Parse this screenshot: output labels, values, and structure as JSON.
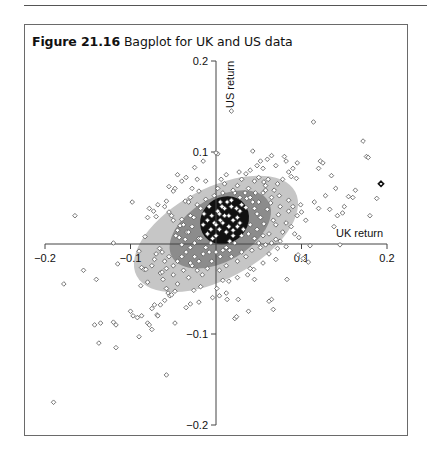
{
  "figure": {
    "label": "Figure 21.16",
    "title": "Bagplot for UK and US data"
  },
  "chart_data": {
    "type": "scatter",
    "subtype": "bagplot",
    "title": "Bagplot for UK and US data",
    "xlabel": "UK return",
    "ylabel": "US return",
    "xlim": [
      -0.2,
      0.2
    ],
    "ylim": [
      -0.2,
      0.2
    ],
    "xticks": [
      -0.2,
      -0.1,
      0.1,
      0.2
    ],
    "yticks": [
      0.2,
      0.1,
      -0.1,
      -0.2
    ],
    "xtick_labels": [
      "-0.2",
      "-0.1",
      "0.1",
      "0.2"
    ],
    "ytick_labels": [
      "0.2",
      "0.1",
      "-0.1",
      "-0.2"
    ],
    "grid": false,
    "legend": null,
    "axes_through_origin": true,
    "colors": {
      "fence": "#c6c6c6",
      "bag": "#8c8c8c",
      "center": "#111111",
      "points": "#555555"
    },
    "regions": {
      "fence_ellipse": {
        "cx": 0.0,
        "cy": 0.01,
        "rx": 0.105,
        "ry": 0.05,
        "angle_deg": -28
      },
      "bag_ellipse": {
        "cx": 0.005,
        "cy": 0.015,
        "rx": 0.065,
        "ry": 0.035,
        "angle_deg": -30
      },
      "center_blob": {
        "cx": 0.01,
        "cy": 0.025,
        "rx": 0.03,
        "ry": 0.025,
        "angle_deg": -40
      }
    },
    "outlier_marked": {
      "x": 0.193,
      "y": 0.065
    },
    "points": [
      [
        -0.19,
        -0.175
      ],
      [
        -0.178,
        -0.045
      ],
      [
        -0.165,
        0.03
      ],
      [
        -0.155,
        -0.03
      ],
      [
        -0.14,
        -0.04
      ],
      [
        -0.142,
        -0.09
      ],
      [
        -0.135,
        -0.088
      ],
      [
        -0.137,
        -0.11
      ],
      [
        -0.12,
        -0.087
      ],
      [
        -0.117,
        -0.09
      ],
      [
        -0.115,
        -0.023
      ],
      [
        -0.12,
        0.0
      ],
      [
        -0.117,
        -0.115
      ],
      [
        -0.098,
        0.045
      ],
      [
        -0.09,
        -0.009
      ],
      [
        -0.087,
        -0.027
      ],
      [
        -0.088,
        -0.047
      ],
      [
        -0.09,
        -0.103
      ],
      [
        -0.084,
        -0.029
      ],
      [
        -0.082,
        -0.029
      ],
      [
        -0.08,
        -0.043
      ],
      [
        -0.08,
        -0.088
      ],
      [
        -0.083,
        0.007
      ],
      [
        -0.075,
        -0.095
      ],
      [
        -0.069,
        -0.079
      ],
      [
        -0.068,
        -0.08
      ],
      [
        -0.065,
        -0.068
      ],
      [
        -0.065,
        -0.033
      ],
      [
        -0.063,
        -0.032
      ],
      [
        -0.058,
        -0.05
      ],
      [
        -0.056,
        -0.055
      ],
      [
        -0.054,
        -0.058
      ],
      [
        -0.052,
        -0.057
      ],
      [
        -0.048,
        -0.088
      ],
      [
        -0.048,
        -0.053
      ],
      [
        -0.058,
        -0.145
      ],
      [
        -0.1,
        -0.075
      ],
      [
        -0.097,
        -0.08
      ],
      [
        -0.092,
        -0.082
      ],
      [
        -0.087,
        -0.08
      ],
      [
        -0.08,
        0.028
      ],
      [
        -0.078,
        0.038
      ],
      [
        -0.073,
        0.035
      ],
      [
        -0.07,
        0.029
      ],
      [
        -0.068,
        0.042
      ],
      [
        -0.06,
        0.04
      ],
      [
        -0.058,
        0.046
      ],
      [
        -0.055,
        0.034
      ],
      [
        -0.052,
        0.03
      ],
      [
        -0.05,
        0.025
      ],
      [
        -0.078,
        -0.09
      ],
      [
        -0.075,
        -0.072
      ],
      [
        -0.072,
        -0.068
      ],
      [
        -0.06,
        -0.063
      ],
      [
        -0.047,
        0.008
      ],
      [
        -0.045,
        0.014
      ],
      [
        -0.043,
        0.006
      ],
      [
        -0.042,
        0.019
      ],
      [
        -0.04,
        0.026
      ],
      [
        -0.038,
        0.02
      ],
      [
        -0.036,
        0.046
      ],
      [
        -0.034,
        0.012
      ],
      [
        -0.032,
        0.045
      ],
      [
        -0.03,
        0.05
      ],
      [
        -0.03,
        0.03
      ],
      [
        -0.028,
        0.06
      ],
      [
        -0.025,
        0.083
      ],
      [
        -0.022,
        0.07
      ],
      [
        -0.015,
        0.09
      ],
      [
        -0.012,
        0.068
      ],
      [
        -0.02,
        0.057
      ],
      [
        -0.035,
        0.072
      ],
      [
        -0.04,
        0.068
      ],
      [
        -0.045,
        0.075
      ],
      [
        -0.048,
        0.06
      ],
      [
        -0.05,
        0.057
      ],
      [
        -0.055,
        0.062
      ],
      [
        0.018,
        0.145
      ],
      [
        0.002,
        0.098
      ],
      [
        0.0,
        0.099
      ],
      [
        0.027,
        0.078
      ],
      [
        0.043,
        0.101
      ],
      [
        0.056,
        0.067
      ],
      [
        0.061,
        0.07
      ],
      [
        0.058,
        0.063
      ],
      [
        0.046,
        0.055
      ],
      [
        0.036,
        0.049
      ],
      [
        0.058,
        0.058
      ],
      [
        0.074,
        0.052
      ],
      [
        0.085,
        0.047
      ],
      [
        0.094,
        0.071
      ],
      [
        0.1,
        0.034
      ],
      [
        0.114,
        0.133
      ],
      [
        0.12,
        0.082
      ],
      [
        0.122,
        0.09
      ],
      [
        0.125,
        0.088
      ],
      [
        0.135,
        0.074
      ],
      [
        0.14,
        0.06
      ],
      [
        0.142,
        0.03
      ],
      [
        0.148,
        0.033
      ],
      [
        0.15,
        0.04
      ],
      [
        0.155,
        0.051
      ],
      [
        0.16,
        0.05
      ],
      [
        0.163,
        0.058
      ],
      [
        0.172,
        0.112
      ],
      [
        0.176,
        0.095
      ],
      [
        0.178,
        0.094
      ],
      [
        0.18,
        0.03
      ],
      [
        0.188,
        0.049
      ],
      [
        0.145,
        -0.002
      ],
      [
        0.11,
        -0.003
      ],
      [
        0.082,
        -0.004
      ],
      [
        0.052,
        -0.005
      ],
      [
        0.096,
        -0.013
      ],
      [
        0.108,
        -0.021
      ],
      [
        0.102,
        -0.017
      ],
      [
        0.062,
        -0.012
      ],
      [
        0.07,
        -0.018
      ],
      [
        0.055,
        -0.022
      ],
      [
        0.044,
        -0.029
      ],
      [
        0.04,
        -0.028
      ],
      [
        0.037,
        -0.035
      ],
      [
        0.025,
        -0.038
      ],
      [
        0.015,
        -0.042
      ],
      [
        0.008,
        -0.041
      ],
      [
        0.012,
        -0.055
      ],
      [
        0.004,
        -0.058
      ],
      [
        0.013,
        -0.062
      ],
      [
        0.026,
        -0.062
      ],
      [
        0.038,
        -0.075
      ],
      [
        0.065,
        -0.062
      ],
      [
        0.067,
        -0.073
      ],
      [
        0.062,
        -0.064
      ],
      [
        0.022,
        -0.083
      ],
      [
        0.024,
        -0.081
      ],
      [
        0.045,
        -0.04
      ],
      [
        0.083,
        -0.04
      ],
      [
        0.004,
        -0.03
      ],
      [
        0.001,
        -0.05
      ],
      [
        -0.004,
        -0.06
      ],
      [
        -0.02,
        -0.065
      ],
      [
        -0.03,
        -0.067
      ],
      [
        -0.035,
        -0.071
      ],
      [
        -0.026,
        -0.052
      ],
      [
        -0.018,
        -0.048
      ],
      [
        0.018,
        0.047
      ],
      [
        0.022,
        0.055
      ],
      [
        0.03,
        0.042
      ],
      [
        0.035,
        0.039
      ],
      [
        0.038,
        0.06
      ],
      [
        0.043,
        0.045
      ],
      [
        0.048,
        0.032
      ],
      [
        0.052,
        0.028
      ],
      [
        0.056,
        0.021
      ],
      [
        0.06,
        0.037
      ],
      [
        0.064,
        0.044
      ],
      [
        0.067,
        0.025
      ],
      [
        0.07,
        0.02
      ],
      [
        0.073,
        0.031
      ],
      [
        0.078,
        0.012
      ],
      [
        0.082,
        0.022
      ],
      [
        0.088,
        0.018
      ],
      [
        0.092,
        0.01
      ],
      [
        0.097,
        0.006
      ],
      [
        0.099,
        0.042
      ],
      [
        0.105,
        0.025
      ],
      [
        0.115,
        0.045
      ],
      [
        0.12,
        0.038
      ],
      [
        0.128,
        0.052
      ],
      [
        0.133,
        0.037
      ],
      [
        0.138,
        0.018
      ],
      [
        0.068,
        0.058
      ],
      [
        0.072,
        0.065
      ],
      [
        0.078,
        0.07
      ],
      [
        0.085,
        0.078
      ],
      [
        0.088,
        0.073
      ],
      [
        0.09,
        0.082
      ],
      [
        0.095,
        0.088
      ],
      [
        0.015,
        0.03
      ],
      [
        0.02,
        0.025
      ],
      [
        0.025,
        0.018
      ],
      [
        0.028,
        0.035
      ],
      [
        0.032,
        0.015
      ],
      [
        0.038,
        0.01
      ],
      [
        0.04,
        0.02
      ],
      [
        0.045,
        0.005
      ],
      [
        0.048,
        0.015
      ],
      [
        0.05,
        0.0
      ],
      [
        0.055,
        0.008
      ],
      [
        0.058,
        -0.002
      ],
      [
        0.062,
        0.01
      ],
      [
        0.065,
        0.0
      ],
      [
        0.07,
        0.004
      ],
      [
        0.072,
        -0.006
      ],
      [
        0.075,
        0.002
      ],
      [
        0.03,
        -0.01
      ],
      [
        0.025,
        -0.02
      ],
      [
        0.018,
        -0.015
      ],
      [
        0.012,
        -0.025
      ],
      [
        0.005,
        -0.015
      ],
      [
        0.035,
        -0.015
      ],
      [
        0.042,
        -0.008
      ],
      [
        -0.01,
        0.01
      ],
      [
        -0.015,
        0.02
      ],
      [
        -0.02,
        0.005
      ],
      [
        -0.025,
        0.0
      ],
      [
        -0.03,
        -0.005
      ],
      [
        -0.035,
        -0.01
      ],
      [
        -0.04,
        -0.015
      ],
      [
        -0.045,
        -0.02
      ],
      [
        -0.05,
        -0.025
      ],
      [
        -0.055,
        -0.015
      ],
      [
        -0.06,
        -0.02
      ],
      [
        -0.063,
        -0.01
      ],
      [
        -0.066,
        -0.006
      ],
      [
        -0.07,
        -0.012
      ],
      [
        -0.072,
        -0.018
      ],
      [
        -0.075,
        -0.025
      ],
      [
        -0.062,
        -0.04
      ],
      [
        -0.058,
        -0.028
      ],
      [
        -0.05,
        -0.035
      ],
      [
        -0.045,
        -0.045
      ],
      [
        -0.038,
        -0.03
      ],
      [
        -0.032,
        -0.038
      ],
      [
        -0.028,
        -0.025
      ],
      [
        -0.022,
        -0.03
      ],
      [
        -0.016,
        -0.035
      ],
      [
        -0.01,
        -0.028
      ],
      [
        -0.005,
        -0.02
      ],
      [
        -0.008,
        -0.01
      ],
      [
        -0.005,
        0.03
      ],
      [
        -0.008,
        0.04
      ],
      [
        -0.012,
        0.048
      ],
      [
        -0.018,
        0.038
      ],
      [
        -0.022,
        0.042
      ],
      [
        -0.026,
        0.028
      ],
      [
        -0.028,
        0.018
      ],
      [
        -0.032,
        0.012
      ],
      [
        -0.036,
        0.004
      ],
      [
        -0.04,
        -0.002
      ],
      [
        0.005,
        0.045
      ],
      [
        0.008,
        0.055
      ],
      [
        0.002,
        0.06
      ],
      [
        -0.002,
        0.052
      ],
      [
        0.01,
        0.065
      ],
      [
        0.012,
        0.075
      ],
      [
        0.006,
        0.07
      ],
      [
        -0.018,
        0.005
      ],
      [
        -0.012,
        -0.005
      ],
      [
        -0.006,
        0.0
      ],
      [
        0.0,
        0.008
      ],
      [
        0.004,
        0.015
      ],
      [
        0.008,
        0.022
      ],
      [
        0.012,
        0.012
      ],
      [
        0.016,
        0.002
      ],
      [
        0.02,
        0.008
      ],
      [
        0.024,
        0.038
      ],
      [
        0.01,
        0.038
      ],
      [
        0.004,
        0.032
      ],
      [
        -0.002,
        0.022
      ],
      [
        -0.006,
        0.015
      ],
      [
        0.012,
        -0.005
      ],
      [
        0.008,
        -0.008
      ],
      [
        0.0,
        -0.01
      ],
      [
        0.0,
        0.02
      ],
      [
        0.005,
        0.025
      ],
      [
        0.01,
        0.03
      ],
      [
        0.015,
        0.018
      ],
      [
        0.02,
        0.014
      ],
      [
        0.025,
        0.028
      ],
      [
        0.018,
        0.04
      ],
      [
        0.013,
        0.045
      ],
      [
        0.007,
        0.04
      ],
      [
        0.002,
        0.035
      ],
      [
        0.028,
        0.022
      ],
      [
        0.03,
        0.008
      ],
      [
        0.022,
        0.0
      ],
      [
        0.016,
        -0.008
      ],
      [
        -0.004,
        0.005
      ],
      [
        -0.01,
        0.025
      ],
      [
        -0.014,
        0.032
      ],
      [
        0.03,
        0.07
      ],
      [
        0.035,
        0.076
      ],
      [
        0.04,
        0.08
      ],
      [
        0.045,
        0.068
      ],
      [
        0.05,
        0.072
      ],
      [
        0.055,
        0.082
      ],
      [
        0.025,
        0.063
      ],
      [
        0.02,
        0.058
      ],
      [
        0.048,
        0.085
      ],
      [
        0.052,
        0.09
      ],
      [
        0.06,
        0.092
      ],
      [
        0.065,
        0.096
      ],
      [
        0.07,
        0.085
      ],
      [
        0.08,
        0.095
      ],
      [
        0.082,
        0.09
      ],
      [
        0.045,
        0.038
      ],
      [
        0.05,
        0.045
      ],
      [
        0.04,
        0.05
      ],
      [
        0.034,
        0.055
      ],
      [
        0.028,
        0.05
      ],
      [
        -0.025,
        -0.015
      ],
      [
        -0.03,
        -0.022
      ],
      [
        -0.02,
        -0.02
      ],
      [
        -0.015,
        -0.012
      ],
      [
        0.085,
        0.035
      ],
      [
        0.09,
        0.04
      ],
      [
        0.095,
        0.03
      ],
      [
        0.075,
        0.04
      ],
      [
        0.065,
        0.05
      ],
      [
        0.055,
        0.055
      ]
    ]
  }
}
